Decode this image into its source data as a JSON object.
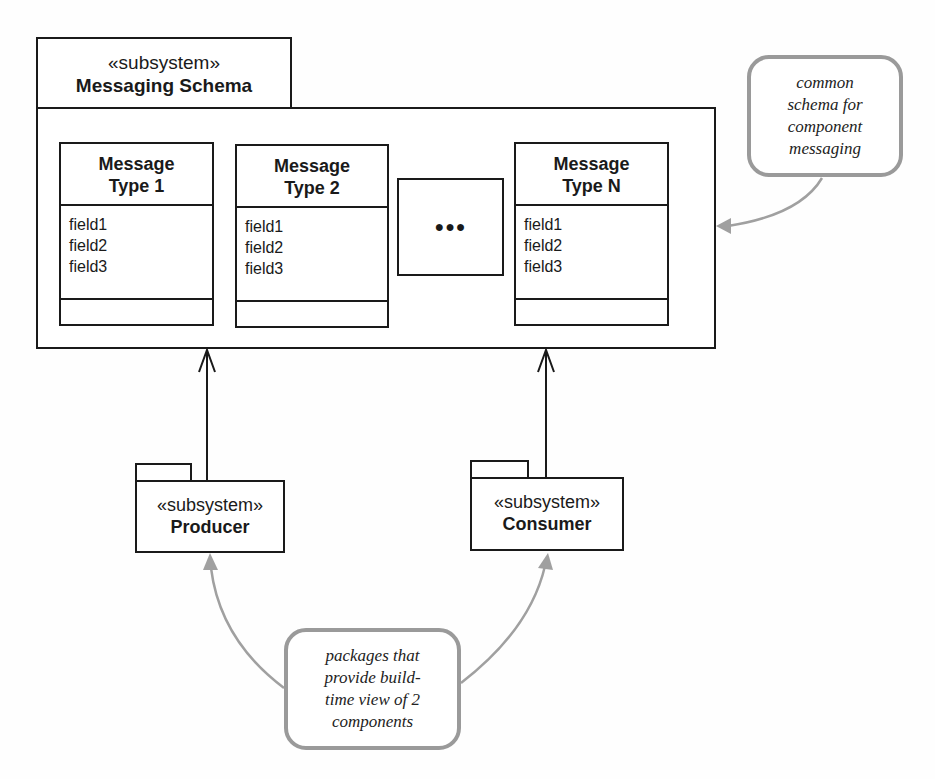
{
  "schema_package": {
    "stereotype": "«subsystem»",
    "name": "Messaging Schema"
  },
  "classes": [
    {
      "title_line1": "Message",
      "title_line2": "Type 1",
      "fields": [
        "field1",
        "field2",
        "field3"
      ]
    },
    {
      "title_line1": "Message",
      "title_line2": "Type 2",
      "fields": [
        "field1",
        "field2",
        "field3"
      ]
    },
    {
      "title_line1": "Message",
      "title_line2": "Type N",
      "fields": [
        "field1",
        "field2",
        "field3"
      ]
    }
  ],
  "ellipsis_box": {
    "label": "●●●"
  },
  "producer_package": {
    "stereotype": "«subsystem»",
    "name": "Producer"
  },
  "consumer_package": {
    "stereotype": "«subsystem»",
    "name": "Consumer"
  },
  "notes": {
    "schema_note": {
      "lines": [
        "common",
        "schema for",
        "component",
        "messaging"
      ]
    },
    "packages_note": {
      "lines": [
        "packages that",
        "provide build-",
        "time view of 2",
        "components"
      ]
    }
  },
  "colors": {
    "line": "#1a1a1a",
    "note_border": "#9a9a9a",
    "note_arrow": "#a0a0a0"
  }
}
